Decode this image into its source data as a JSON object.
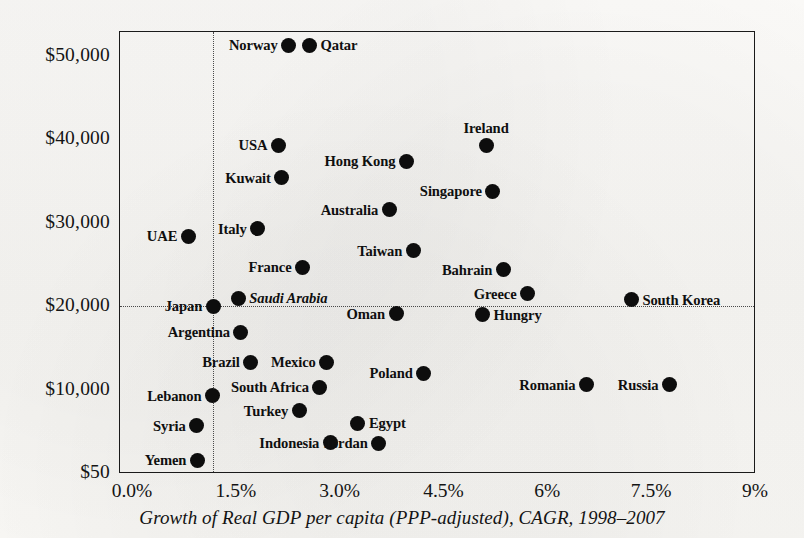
{
  "caption": "Growth of Real GDP per capita (PPP-adjusted), CAGR, 1998–2007",
  "axes": {
    "y_ticks": [
      "$50,000",
      "$40,000",
      "$30,000",
      "$20,000",
      "$10,000",
      "$50"
    ],
    "x_ticks": [
      "0.0%",
      "1.5%",
      "3.0%",
      "4.5%",
      "6%",
      "7.5%",
      "9%"
    ]
  },
  "chart_data": {
    "type": "scatter",
    "title": "",
    "subtitle": "",
    "xlabel": "Growth of Real GDP per capita (PPP-adjusted), CAGR, 1998–2007",
    "ylabel": "",
    "xlim": [
      0.0,
      9.0
    ],
    "ylim": [
      50,
      55000
    ],
    "xtick_values": [
      0.0,
      1.5,
      3.0,
      4.5,
      6.0,
      7.5,
      9.0
    ],
    "xtick_labels": [
      "0.0%",
      "1.5%",
      "3.0%",
      "4.5%",
      "6%",
      "7.5%",
      "9%"
    ],
    "ytick_values": [
      50000,
      40000,
      30000,
      20000,
      10000,
      50
    ],
    "ytick_labels": [
      "$50,000",
      "$40,000",
      "$30,000",
      "$20,000",
      "$10,000",
      "$50"
    ],
    "grid": "dotted",
    "gridlines": {
      "horizontal": [
        20000
      ],
      "vertical": [
        1.15
      ]
    },
    "legend": "none",
    "marker_color": "#0d0d0d",
    "points": [
      {
        "name": "Norway",
        "x": 2.25,
        "y": 51300,
        "label_side": "left",
        "italic": false
      },
      {
        "name": "Qatar",
        "x": 2.55,
        "y": 51300,
        "label_side": "right",
        "italic": false
      },
      {
        "name": "USA",
        "x": 2.1,
        "y": 39300,
        "label_side": "left",
        "italic": false
      },
      {
        "name": "Ireland",
        "x": 5.1,
        "y": 39300,
        "label_side": "above",
        "italic": false
      },
      {
        "name": "Hong Kong",
        "x": 3.95,
        "y": 37400,
        "label_side": "left",
        "italic": false
      },
      {
        "name": "Kuwait",
        "x": 2.15,
        "y": 35400,
        "label_side": "left",
        "italic": false
      },
      {
        "name": "Singapore",
        "x": 5.2,
        "y": 33800,
        "label_side": "left",
        "italic": false
      },
      {
        "name": "Australia",
        "x": 3.7,
        "y": 31600,
        "label_side": "left",
        "italic": false
      },
      {
        "name": "UAE",
        "x": 0.8,
        "y": 28400,
        "label_side": "left",
        "italic": false
      },
      {
        "name": "Italy",
        "x": 1.8,
        "y": 29300,
        "label_side": "left",
        "italic": false
      },
      {
        "name": "Taiwan",
        "x": 4.05,
        "y": 26700,
        "label_side": "left",
        "italic": false
      },
      {
        "name": "France",
        "x": 2.45,
        "y": 24700,
        "label_side": "left",
        "italic": false
      },
      {
        "name": "Bahrain",
        "x": 5.35,
        "y": 24400,
        "label_side": "left",
        "italic": false
      },
      {
        "name": "Japan",
        "x": 1.16,
        "y": 20000,
        "label_side": "left",
        "italic": false
      },
      {
        "name": "Saudi Arabia",
        "x": 1.52,
        "y": 21000,
        "label_side": "right",
        "italic": true
      },
      {
        "name": "Greece",
        "x": 5.7,
        "y": 21500,
        "label_side": "left",
        "italic": false
      },
      {
        "name": "South Korea",
        "x": 7.2,
        "y": 20800,
        "label_side": "right",
        "italic": false
      },
      {
        "name": "Oman",
        "x": 3.8,
        "y": 19100,
        "label_side": "left",
        "italic": false
      },
      {
        "name": "Hungry",
        "x": 5.05,
        "y": 19000,
        "label_side": "right",
        "italic": false
      },
      {
        "name": "Argentina",
        "x": 1.56,
        "y": 16900,
        "label_side": "left",
        "italic": false
      },
      {
        "name": "Brazil",
        "x": 1.7,
        "y": 13300,
        "label_side": "left",
        "italic": false
      },
      {
        "name": "Mexico",
        "x": 2.8,
        "y": 13300,
        "label_side": "left",
        "italic": false
      },
      {
        "name": "Poland",
        "x": 4.2,
        "y": 12000,
        "label_side": "left",
        "italic": false
      },
      {
        "name": "Romania",
        "x": 6.55,
        "y": 10600,
        "label_side": "left",
        "italic": false
      },
      {
        "name": "Russia",
        "x": 7.75,
        "y": 10600,
        "label_side": "left",
        "italic": false
      },
      {
        "name": "South Africa",
        "x": 2.7,
        "y": 10300,
        "label_side": "left",
        "italic": false
      },
      {
        "name": "Lebanon",
        "x": 1.15,
        "y": 9300,
        "label_side": "left",
        "italic": false
      },
      {
        "name": "Turkey",
        "x": 2.4,
        "y": 7500,
        "label_side": "left",
        "italic": false
      },
      {
        "name": "Syria",
        "x": 0.92,
        "y": 5700,
        "label_side": "left",
        "italic": false
      },
      {
        "name": "Egypt",
        "x": 3.25,
        "y": 6000,
        "label_side": "right",
        "italic": false
      },
      {
        "name": "Indonesia",
        "x": 2.85,
        "y": 3700,
        "label_side": "left",
        "italic": false
      },
      {
        "name": "Jordan",
        "x": 3.55,
        "y": 3600,
        "label_side": "left",
        "italic": false
      },
      {
        "name": "Yemen",
        "x": 0.93,
        "y": 1600,
        "label_side": "left",
        "italic": false
      }
    ]
  }
}
